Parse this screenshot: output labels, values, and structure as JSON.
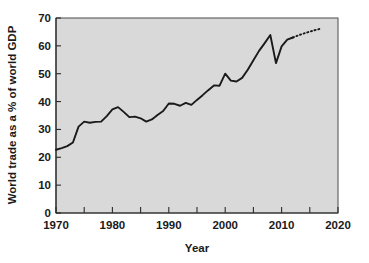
{
  "chart_data": {
    "type": "line",
    "title": "",
    "xlabel": "Year",
    "ylabel": "World trade as a % of world GDP",
    "xlim": [
      1970,
      2020
    ],
    "ylim": [
      0,
      70
    ],
    "grid": false,
    "legend": "none",
    "x_ticks": [
      1970,
      1980,
      1990,
      2000,
      2010,
      2020
    ],
    "x_tick_labels": [
      "1970",
      "1980",
      "1990",
      "2000",
      "2010",
      "2020"
    ],
    "x_minor_ticks": [
      1975,
      1985,
      1995,
      2005,
      2015
    ],
    "y_ticks": [
      0,
      10,
      20,
      30,
      40,
      50,
      60,
      70
    ],
    "y_tick_labels": [
      "0",
      "10",
      "20",
      "30",
      "40",
      "50",
      "60",
      "70"
    ],
    "series": [
      {
        "name": "World trade as a % of world GDP",
        "style": "solid",
        "x": [
          1970,
          1971,
          1972,
          1973,
          1974,
          1975,
          1976,
          1977,
          1978,
          1979,
          1980,
          1981,
          1982,
          1983,
          1984,
          1985,
          1986,
          1987,
          1988,
          1989,
          1990,
          1991,
          1992,
          1993,
          1994,
          1995,
          1996,
          1997,
          1998,
          1999,
          2000,
          2001,
          2002,
          2003,
          2004,
          2005,
          2006,
          2007,
          2008,
          2009,
          2010,
          2011,
          2012
        ],
        "values": [
          22.7,
          23.3,
          24.0,
          25.3,
          31.0,
          32.8,
          32.4,
          32.7,
          32.8,
          34.8,
          37.2,
          38.0,
          36.3,
          34.4,
          34.6,
          34.0,
          32.8,
          33.6,
          35.2,
          36.6,
          39.3,
          39.2,
          38.5,
          39.5,
          38.8,
          40.6,
          42.3,
          44.1,
          45.8,
          45.7,
          50.0,
          47.5,
          47.2,
          48.5,
          51.4,
          54.8,
          58.2,
          61.0,
          63.9,
          53.8,
          59.8,
          62.2,
          63.0
        ]
      },
      {
        "name": "Projection",
        "style": "dotted",
        "x": [
          2012,
          2013,
          2014,
          2015,
          2016,
          2017
        ],
        "values": [
          63.0,
          63.8,
          64.5,
          65.1,
          65.7,
          66.2
        ]
      }
    ]
  }
}
